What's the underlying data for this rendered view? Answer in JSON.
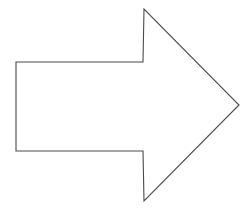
{
  "canvas": {
    "width": 248,
    "height": 216,
    "background_color": "#ffffff"
  },
  "figure": {
    "name": "right-pointing-arrow",
    "description": "Right pointing arrow outline",
    "stroke_color": "#4a4a4a",
    "fill_color": "#ffffff",
    "stroke_width": 1.1,
    "points": "16,62 143,62 144,9 239,105 144,201 143,151 16,151",
    "vertices": [
      {
        "label": "shaft-top-left",
        "x": 16,
        "y": 62
      },
      {
        "label": "shaft-top-right",
        "x": 143,
        "y": 62
      },
      {
        "label": "head-top-apex",
        "x": 144,
        "y": 9
      },
      {
        "label": "head-right-tip",
        "x": 239,
        "y": 105
      },
      {
        "label": "head-bottom-apex",
        "x": 144,
        "y": 201
      },
      {
        "label": "shaft-bottom-right",
        "x": 143,
        "y": 151
      },
      {
        "label": "shaft-bottom-left",
        "x": 16,
        "y": 151
      }
    ]
  }
}
